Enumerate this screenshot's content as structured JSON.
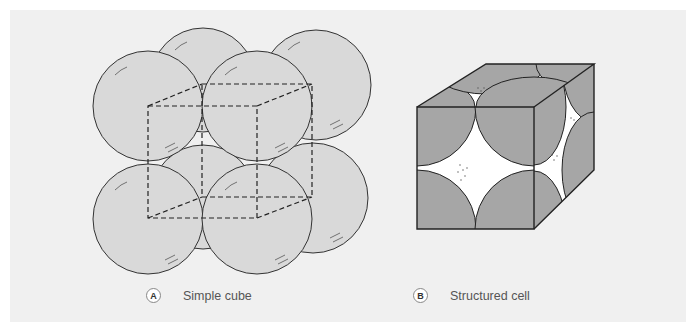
{
  "figure": {
    "panels": [
      {
        "id": "A",
        "badge": "A",
        "label": "Simple cube"
      },
      {
        "id": "B",
        "badge": "B",
        "label": "Structured cell"
      }
    ],
    "colors": {
      "background": "#f0f0f0",
      "sphere_fill": "#d9d9d9",
      "face_fill": "#a6a6a6",
      "outline": "#333333"
    }
  }
}
